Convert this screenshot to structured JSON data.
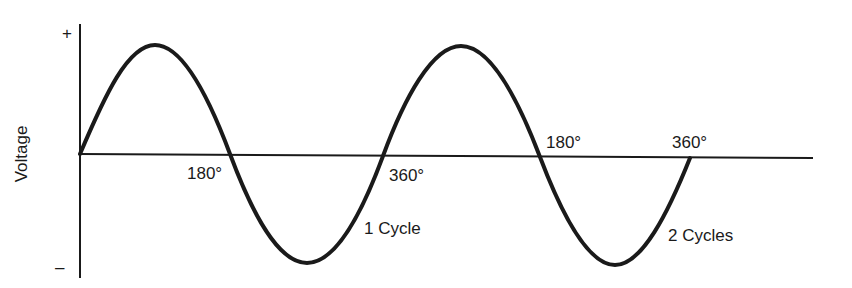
{
  "diagram": {
    "type": "sine-wave-cycles",
    "axis": {
      "y_label": "Voltage",
      "plus_sign": "+",
      "minus_sign": "–"
    },
    "angle_labels": {
      "first_180": "180°",
      "first_360": "360°",
      "second_180": "180°",
      "second_360": "360°"
    },
    "cycle_labels": {
      "one_cycle": "1 Cycle",
      "two_cycles": "2 Cycles"
    },
    "colors": {
      "line": "#1a1a1a",
      "background": "#ffffff"
    }
  }
}
